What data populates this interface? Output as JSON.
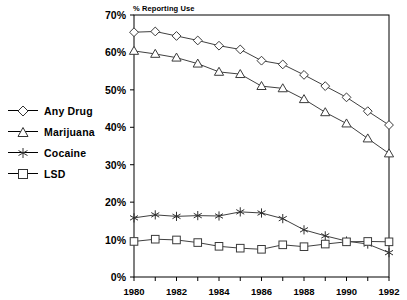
{
  "chart_data": {
    "type": "line",
    "title": "% Reporting Use",
    "xlabel": "",
    "ylabel": "",
    "grid": false,
    "legend_position": "left-outside",
    "xlim": [
      1980,
      1992
    ],
    "ylim": [
      0,
      70
    ],
    "ytick_labels": [
      "0%",
      "10%",
      "20%",
      "30%",
      "40%",
      "50%",
      "60%",
      "70%"
    ],
    "ytick_values": [
      0,
      10,
      20,
      30,
      40,
      50,
      60,
      70
    ],
    "xtick_labels": [
      "1980",
      "1982",
      "1984",
      "1986",
      "1988",
      "1990",
      "1992"
    ],
    "xtick_values": [
      1980,
      1982,
      1984,
      1986,
      1988,
      1990,
      1992
    ],
    "x": [
      1980,
      1981,
      1982,
      1983,
      1984,
      1985,
      1986,
      1987,
      1988,
      1989,
      1990,
      1991,
      1992
    ],
    "series": [
      {
        "name": "Any Drug",
        "marker": "diamond",
        "values": [
          65.4,
          65.6,
          64.4,
          63.2,
          61.8,
          60.8,
          57.8,
          56.8,
          54.0,
          51.0,
          48.0,
          44.3,
          40.6
        ]
      },
      {
        "name": "Marijuana",
        "marker": "triangle",
        "values": [
          60.4,
          59.6,
          58.6,
          57.0,
          54.8,
          54.2,
          51.0,
          50.4,
          47.5,
          44.0,
          41.0,
          37.0,
          33.0
        ]
      },
      {
        "name": "Cocaine",
        "marker": "asterisk",
        "values": [
          15.8,
          16.6,
          16.2,
          16.4,
          16.3,
          17.4,
          17.1,
          15.6,
          12.6,
          11.0,
          9.6,
          8.8,
          6.5
        ]
      },
      {
        "name": "LSD",
        "marker": "square",
        "values": [
          9.5,
          10.1,
          9.9,
          9.2,
          8.2,
          7.7,
          7.4,
          8.6,
          8.1,
          8.8,
          9.4,
          9.5,
          9.4
        ]
      }
    ]
  },
  "legend": {
    "items": [
      {
        "label": "Any Drug",
        "marker": "diamond"
      },
      {
        "label": "Marijuana",
        "marker": "triangle"
      },
      {
        "label": "Cocaine",
        "marker": "asterisk"
      },
      {
        "label": "LSD",
        "marker": "square"
      }
    ]
  },
  "colors": {
    "line": "#404040",
    "axis": "#000000",
    "text": "#000000",
    "background": "#ffffff"
  }
}
